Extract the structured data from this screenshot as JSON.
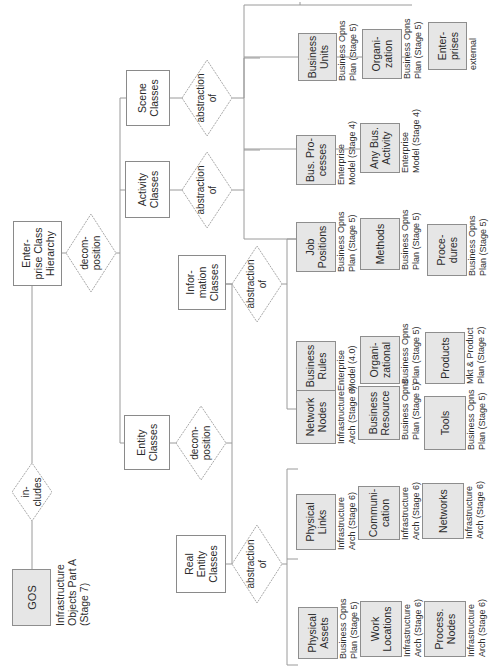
{
  "diagram": {
    "root": {
      "label": "Enter-\nprise Class\nHierarchy"
    },
    "gos": {
      "label": "GOS",
      "note": "Infrastructure\nObjects Part A\n(Stage 7)"
    },
    "relations": {
      "includes": "in-\ncludes",
      "decomposition_top": "decom-\nposition",
      "decomposition_entity": "decom-\nposition",
      "abstraction_scene": "abstraction\nof",
      "abstraction_activity": "abstraction\nof",
      "abstraction_information": "abstraction\nof",
      "abstraction_real_entity": "abstraction\nof"
    },
    "classes": {
      "scene": "Scene\nClasses",
      "activity": "Activity\nClasses",
      "entity": "Entity\nClasses",
      "information": "Infor-\nmation\nClasses",
      "real_entity": "Real\nEntity\nClasses"
    },
    "scene_leaves": [
      {
        "label": "Business\nUnits",
        "note": "Business Opns\nPlan (Stage 5)"
      },
      {
        "label": "Organi-\nzation",
        "note": "Business Opns\nPlan (Stage 5)"
      },
      {
        "label": "Enter-\nprises",
        "note": "external"
      }
    ],
    "activity_leaves": [
      {
        "label": "Bus. Pro-\ncesses",
        "note": "Enterprise\nModel (Stage 4)"
      },
      {
        "label": "Any Bus.\nActivity",
        "note": "Enterprise\nModel (Stage 4)"
      }
    ],
    "information_leaves": [
      {
        "label": "Business\nRules",
        "note": "Enterprise\nModel (4.0)"
      },
      {
        "label": "Organi-\nzational",
        "note": "Business Opns\nPlan (Stage 5)"
      },
      {
        "label": "Products",
        "note": "Mkt & Product\nPlan (Stage 2)"
      },
      {
        "label": "Job\nPositions",
        "note": "Business Opns\nPlan (Stage 5)"
      },
      {
        "label": "Methods",
        "note": "Business Opns\nPlan (Stage 5)"
      },
      {
        "label": "Proce-\ndures",
        "note": "Business Opns\nPlan (Stage 5)"
      }
    ],
    "real_entity_leaves": [
      {
        "label": "Physical\nAssets",
        "note": "Business Opns\nPlan (Stage 5)"
      },
      {
        "label": "Work\nLocations",
        "note": "Infrastructure\nArch (Stage 6)"
      },
      {
        "label": "Process.\nNodes",
        "note": "Infrastructure\nArch (Stage 6)"
      },
      {
        "label": "Physical\nLinks",
        "note": "Infrastructure\nArch (Stage 6)"
      },
      {
        "label": "Communi-\ncation",
        "note": "Infrastructure\nArch (Stage 6)"
      },
      {
        "label": "Networks",
        "note": "Infrastructure\nArch (Stage 6)"
      },
      {
        "label": "Network\nNodes",
        "note": "Infrastructure\nArch (Stage 6)"
      },
      {
        "label": "Business\nResource",
        "note": "Business Opns\nPlan (Stage 5)"
      },
      {
        "label": "Tools",
        "note": "Business Opns\nPlan (Stage 5)"
      }
    ],
    "colors": {
      "line": "#9a9a9a",
      "diamond_stroke": "#a8a8a8",
      "leaf_fill": "#e6e6e6",
      "box_border": "#8a8a8a"
    }
  }
}
